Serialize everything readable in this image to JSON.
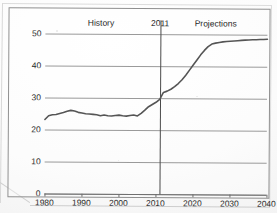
{
  "figure": {
    "frame": true,
    "annotation_labels": {
      "history": "History",
      "divider": "2011",
      "projections": "Projections"
    },
    "caption_fragment": ""
  },
  "chart_data": {
    "type": "line",
    "title": "",
    "subtitle": "",
    "xlabel": "",
    "ylabel": "",
    "xlim": [
      1980,
      2040
    ],
    "ylim": [
      0,
      50
    ],
    "grid": true,
    "legend": null,
    "legend_position": "none",
    "xticks": [
      1980,
      1990,
      2000,
      2010,
      2020,
      2030,
      2040
    ],
    "xtick_labels": [
      "1980",
      "1990",
      "2000",
      "2010",
      "2020",
      "2030",
      "2040"
    ],
    "yticks": [
      0,
      10,
      20,
      30,
      40,
      50
    ],
    "ytick_labels": [
      "0",
      "10",
      "20",
      "30",
      "40",
      "50"
    ],
    "annotations": [
      {
        "text": "History",
        "x": 1995,
        "y": 50,
        "placement": "above-axis"
      },
      {
        "text": "2011",
        "x": 2011,
        "y": 50,
        "placement": "above-axis"
      },
      {
        "text": "Projections",
        "x": 2026,
        "y": 50,
        "placement": "above-axis"
      }
    ],
    "divider_x": 2011,
    "series": [
      {
        "name": "series-1",
        "color": "#555555",
        "x": [
          1980,
          1981,
          1982,
          1983,
          1984,
          1985,
          1986,
          1987,
          1988,
          1989,
          1990,
          1991,
          1992,
          1993,
          1994,
          1995,
          1996,
          1997,
          1998,
          1999,
          2000,
          2001,
          2002,
          2003,
          2004,
          2005,
          2006,
          2007,
          2008,
          2009,
          2010,
          2011,
          2012,
          2013,
          2014,
          2015,
          2016,
          2017,
          2018,
          2019,
          2020,
          2021,
          2022,
          2023,
          2024,
          2025,
          2026,
          2027,
          2028,
          2029,
          2030,
          2031,
          2032,
          2033,
          2034,
          2035,
          2036,
          2037,
          2038,
          2039,
          2040
        ],
        "values": [
          23.1,
          24.3,
          24.6,
          24.7,
          25.0,
          25.3,
          25.7,
          26.0,
          25.8,
          25.4,
          25.2,
          25.0,
          24.9,
          24.8,
          24.7,
          24.4,
          24.6,
          24.4,
          24.3,
          24.5,
          24.6,
          24.4,
          24.3,
          24.5,
          24.7,
          24.4,
          25.2,
          26.2,
          27.3,
          28.0,
          28.7,
          29.6,
          31.8,
          32.2,
          32.8,
          33.6,
          34.6,
          35.8,
          37.2,
          38.8,
          40.4,
          42.0,
          43.6,
          45.0,
          46.2,
          47.0,
          47.3,
          47.5,
          47.7,
          47.8,
          47.9,
          48.0,
          48.1,
          48.2,
          48.3,
          48.35,
          48.4,
          48.45,
          48.5,
          48.5,
          48.6
        ]
      }
    ]
  }
}
